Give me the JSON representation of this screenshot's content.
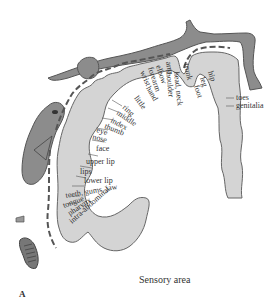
{
  "figure": {
    "caption": "Sensory area",
    "panel_label": "A",
    "colors": {
      "cortex_fill": "#d4d4d4",
      "body_fill": "#8c8c8c",
      "outline": "#555555",
      "text": "#333333",
      "background": "#ffffff"
    },
    "labels": {
      "toes": "toes",
      "genitalia": "genitalia",
      "foot": "foot",
      "leg": "leg",
      "hip": "hip",
      "trunk": "trunk",
      "neck": "head, neck",
      "shoulder": "shoulder",
      "arm": "arm",
      "elbow": "elbow",
      "forearm": "forearm",
      "wrist": "wrist",
      "hand": "hand",
      "little": "little",
      "ring": "ring",
      "middle": "middle",
      "index": "index",
      "thumb": "thumb",
      "eye": "eye",
      "nose": "nose",
      "face": "face",
      "upper_lip": "upper lip",
      "lips": "lips",
      "lower_lip": "lower lip",
      "teeth": "teeth, gums, jaw",
      "tongue": "tongue",
      "pharynx": "pharynx",
      "intra_abdominal": "intra-abdominal"
    }
  }
}
